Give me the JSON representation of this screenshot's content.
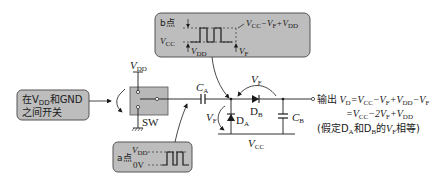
{
  "diagram": {
    "colors": {
      "callout_fill": "#bdbdbd",
      "switch_fill": "#b8b8b8",
      "line": "#1a1a1a"
    },
    "switch_callout": {
      "line1": "在V",
      "line1_sub": "DD",
      "line1_tail": "和GND",
      "line2": "之间开关"
    },
    "switch": {
      "label": "SW",
      "supply_label": "V",
      "supply_sub": "DD"
    },
    "capacitor_a": {
      "label": "C",
      "sub": "A"
    },
    "capacitor_b": {
      "label": "C",
      "sub": "B"
    },
    "diode_a": {
      "label": "D",
      "sub": "A"
    },
    "diode_b": {
      "label": "D",
      "sub": "B"
    },
    "vf_left": {
      "label": "V",
      "sub": "F"
    },
    "vf_top": {
      "label": "V",
      "sub": "F"
    },
    "vcc_bottom": {
      "label": "V",
      "sub": "CC"
    },
    "point_b_callout": {
      "title": "b点",
      "vcc_label": "V",
      "vcc_sub": "CC",
      "vdd_label": "V",
      "vdd_sub": "DD",
      "vf_label": "V",
      "vf_sub": "F",
      "top_level": "V",
      "top_sub1": "CC",
      "top_mid": "−V",
      "top_sub2": "F",
      "top_plus": "+V",
      "top_sub3": "DD"
    },
    "point_a_callout": {
      "title": "a点",
      "high_label": "V",
      "high_sub": "DD",
      "low_label": "0V"
    },
    "output": {
      "prefix": "输出",
      "line1": {
        "v": "V",
        "v_sub": "D",
        "eq": "=V",
        "s1": "CC",
        "m1": "−V",
        "s2": "F",
        "p1": "+V",
        "s3": "DD",
        "m2": "−V",
        "s4": "F"
      },
      "line2": {
        "eq": "=V",
        "s1": "CC",
        "m1": "−2V",
        "s2": "F",
        "p1": "+V",
        "s3": "DD"
      },
      "note": {
        "pre": "(假定D",
        "sa": "A",
        "mid": "和D",
        "sb": "B",
        "tail": "的",
        "v": "V",
        "vs": "F",
        "end": "相等)"
      }
    }
  }
}
